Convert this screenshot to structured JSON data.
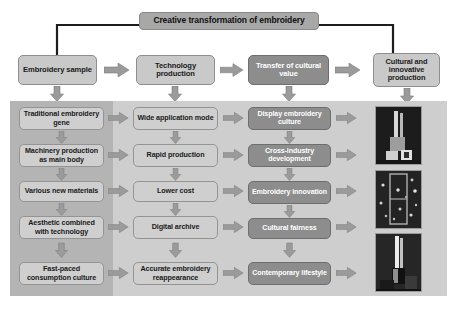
{
  "title": {
    "text": "Creative transformation of embroidery"
  },
  "row_top": {
    "boxes": [
      {
        "label": "Embroidery sample",
        "style": "light"
      },
      {
        "label": "Technology production",
        "style": "light"
      },
      {
        "label": "Transfer of cultural value",
        "style": "dark"
      },
      {
        "label": "Cultural and innovative production",
        "style": "light"
      }
    ]
  },
  "columns": [
    {
      "name": "embroidery-sample-column",
      "items": [
        "Traditional embroidery gene",
        "Machinery production as main body",
        "Various new materials",
        "Aesthetic combined with technology",
        "Fast-paced consumption culture"
      ]
    },
    {
      "name": "technology-production-column",
      "items": [
        "Wide application mode",
        "Rapid production",
        "Lower cost",
        "Digital archive",
        "Accurate embroidery reappearance"
      ]
    },
    {
      "name": "transfer-of-cultural-value-column",
      "items": [
        "Display embroidery culture",
        "Cross-industry development",
        "Embroidery innovation",
        "Cultural fairness",
        "Contemporary lifestyle"
      ]
    }
  ],
  "photos": [
    {
      "caption": "embroidery product photo 1"
    },
    {
      "caption": "embroidery product photo 2"
    },
    {
      "caption": "embroidery product photo 3"
    }
  ],
  "colors": {
    "title_box": "#a8a8a8",
    "light_box": "#c9c9c9",
    "dark_box": "#8d8d8d",
    "panel_left": "#b4b4b4",
    "panel_right": "#cecece",
    "arrow": "#9b9b9b",
    "line": "#1d1d1d"
  },
  "icons": {
    "arrow_right": "arrow-right-icon",
    "arrow_down": "arrow-down-icon"
  }
}
